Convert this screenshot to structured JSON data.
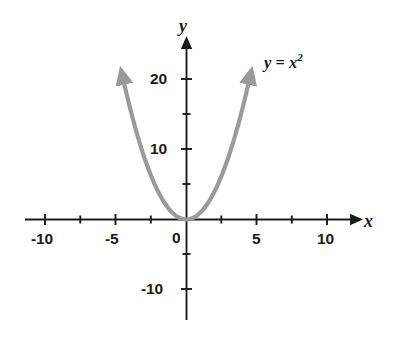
{
  "chart_data": {
    "type": "line",
    "title": "",
    "subtitle": "",
    "xlabel": "x",
    "ylabel": "y",
    "annotation": "y = x²",
    "annotation_parts": {
      "lhs": "y",
      "eq": " = ",
      "base": "x",
      "exponent": "2"
    },
    "function": "y = x^2",
    "grid": false,
    "legend": "none",
    "xlim": [
      -11.5,
      11.8
    ],
    "ylim": [
      -13.5,
      23.5
    ],
    "x_major_labels": [
      "-10",
      "-5",
      "0",
      "5",
      "10"
    ],
    "x_major_values": [
      -10,
      -5,
      0,
      5,
      10
    ],
    "x_tick_values": [
      -10,
      -7.5,
      -5,
      -2.5,
      0,
      2.5,
      5,
      7.5,
      10
    ],
    "x_tick_interval": 2.5,
    "y_major_labels": [
      "20",
      "10",
      "-10"
    ],
    "y_major_values": [
      20,
      10,
      -10
    ],
    "y_tick_values": [
      -10,
      -5,
      5,
      10,
      15,
      20
    ],
    "y_tick_interval": 5,
    "series": [
      {
        "name": "y = x²",
        "color": "#9a9a9a",
        "line_width": 4.2,
        "arrow_both_ends": true,
        "x_domain": [
          -4.45,
          4.45
        ],
        "x": [
          -4.45,
          -4.2,
          -4.0,
          -3.75,
          -3.5,
          -3.25,
          -3.0,
          -2.75,
          -2.5,
          -2.25,
          -2.0,
          -1.75,
          -1.5,
          -1.25,
          -1.0,
          -0.75,
          -0.5,
          -0.25,
          0,
          0.25,
          0.5,
          0.75,
          1.0,
          1.25,
          1.5,
          1.75,
          2.0,
          2.25,
          2.5,
          2.75,
          3.0,
          3.25,
          3.5,
          3.75,
          4.0,
          4.2,
          4.45
        ],
        "y": [
          19.8,
          17.64,
          16.0,
          14.06,
          12.25,
          10.56,
          9.0,
          7.56,
          6.25,
          5.06,
          4.0,
          3.06,
          2.25,
          1.56,
          1.0,
          0.56,
          0.25,
          0.06,
          0,
          0.06,
          0.25,
          0.56,
          1.0,
          1.56,
          2.25,
          3.06,
          4.0,
          5.06,
          6.25,
          7.56,
          9.0,
          10.56,
          12.25,
          14.06,
          16.0,
          17.64,
          19.8
        ]
      }
    ]
  },
  "axes": {
    "color": "#1a1a1a",
    "x_axis_name": "x",
    "y_axis_name": "y",
    "x_axis_arrow": "right-arrow-icon",
    "y_axis_arrow": "up-arrow-icon"
  },
  "labels": {
    "x_neg10": "-10",
    "x_neg5": "-5",
    "origin": "0",
    "x_5": "5",
    "x_10": "10",
    "y_20": "20",
    "y_10": "10",
    "y_neg10": "-10"
  },
  "colors": {
    "curve": "#9a9a9a",
    "axis": "#1a1a1a",
    "background": "#ffffff",
    "text": "#1a1a1a"
  }
}
